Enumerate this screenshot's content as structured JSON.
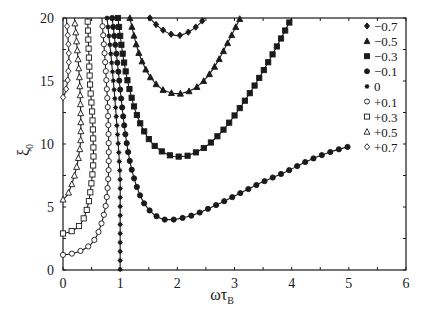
{
  "chart_data": {
    "type": "line",
    "title": "",
    "xlabel": "ωτ",
    "xlabel_sub": "B",
    "ylabel": "ξ",
    "ylabel_sub": "0",
    "xlim": [
      0,
      6
    ],
    "ylim": [
      0,
      20
    ],
    "xticks": [
      "0",
      "1",
      "2",
      "3",
      "4",
      "5",
      "6"
    ],
    "yticks": [
      "0",
      "5",
      "10",
      "15",
      "20"
    ],
    "grid": false,
    "legend_position": "upper right (inside)",
    "series": [
      {
        "name": "−0.7",
        "marker": "diamond-filled",
        "x": [
          1.52,
          1.6,
          1.7,
          1.8,
          1.9,
          2.0,
          2.1,
          2.2,
          2.3,
          2.4,
          2.48
        ],
        "y": [
          20,
          19.6,
          19.2,
          18.9,
          18.7,
          18.6,
          18.7,
          18.9,
          19.2,
          19.6,
          20
        ]
      },
      {
        "name": "−0.5",
        "marker": "triangle-filled",
        "x": [
          1.17,
          1.3,
          1.45,
          1.6,
          1.75,
          1.9,
          2.0,
          2.1,
          2.3,
          2.5,
          2.7,
          2.9,
          3.1
        ],
        "y": [
          20,
          17.6,
          15.9,
          14.9,
          14.3,
          14.05,
          14.0,
          14.05,
          14.4,
          15.2,
          16.5,
          18.2,
          20
        ]
      },
      {
        "name": "−0.3",
        "marker": "square-filled",
        "x": [
          0.96,
          1.05,
          1.15,
          1.3,
          1.5,
          1.7,
          1.9,
          2.0,
          2.2,
          2.5,
          2.8,
          3.1,
          3.4,
          3.7,
          4.0
        ],
        "y": [
          20,
          17.0,
          14.6,
          12.2,
          10.4,
          9.5,
          9.05,
          9.0,
          9.1,
          9.8,
          11.1,
          12.9,
          15.0,
          17.4,
          20
        ]
      },
      {
        "name": "−0.1",
        "marker": "circle-filled",
        "x": [
          0.86,
          0.95,
          1.02,
          1.1,
          1.2,
          1.35,
          1.5,
          1.7,
          1.85,
          2.0,
          2.3,
          2.7,
          3.1,
          3.5,
          3.9,
          4.3,
          4.7,
          5.0
        ],
        "y": [
          20,
          16.5,
          13.5,
          10.5,
          8.0,
          5.9,
          4.8,
          4.1,
          4.0,
          4.05,
          4.4,
          5.2,
          6.1,
          7.0,
          7.8,
          8.7,
          9.4,
          9.8
        ]
      },
      {
        "name": "0",
        "marker": "star",
        "x": [
          0.77,
          0.84,
          0.9,
          0.95,
          0.98,
          1.0,
          1.0,
          1.0,
          1.0,
          1.0
        ],
        "y": [
          20,
          17,
          14,
          11,
          9,
          7,
          5,
          3,
          1,
          0
        ]
      },
      {
        "name": "+0.1",
        "marker": "circle-open",
        "x": [
          0.0,
          0.1,
          0.2,
          0.3,
          0.4,
          0.5,
          0.6,
          0.68,
          0.75,
          0.79,
          0.8,
          0.79,
          0.75,
          0.68
        ],
        "y": [
          1.2,
          1.25,
          1.35,
          1.5,
          1.75,
          2.1,
          2.8,
          3.8,
          5.2,
          7.2,
          9.0,
          12.0,
          15.7,
          20
        ]
      },
      {
        "name": "+0.3",
        "marker": "square-open",
        "x": [
          0.0,
          0.1,
          0.2,
          0.3,
          0.38,
          0.45,
          0.5,
          0.53,
          0.53,
          0.51,
          0.47,
          0.43
        ],
        "y": [
          2.9,
          3.0,
          3.2,
          3.6,
          4.3,
          5.4,
          7.0,
          8.5,
          10.0,
          12.5,
          15.0,
          20
        ]
      },
      {
        "name": "+0.5",
        "marker": "triangle-open",
        "x": [
          0.0,
          0.08,
          0.16,
          0.24,
          0.29,
          0.31,
          0.31,
          0.29,
          0.25,
          0.2
        ],
        "y": [
          5.6,
          6.0,
          6.9,
          8.2,
          9.5,
          10.5,
          12.3,
          15.0,
          17.5,
          20
        ]
      },
      {
        "name": "+0.7",
        "marker": "diamond-open",
        "x": [
          0.0,
          0.04,
          0.08,
          0.1,
          0.1,
          0.08,
          0.06
        ],
        "y": [
          13.7,
          14.1,
          15.0,
          16.3,
          17.5,
          18.8,
          20
        ]
      }
    ]
  },
  "legend": {
    "entries": [
      "−0.7",
      "−0.5",
      "−0.3",
      "−0.1",
      "0",
      "+0.1",
      "+0.3",
      "+0.5",
      "+0.7"
    ]
  }
}
